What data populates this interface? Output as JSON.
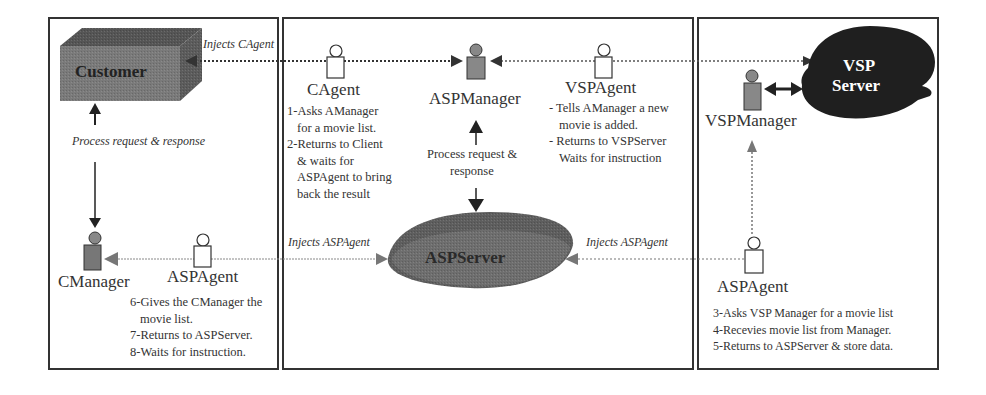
{
  "diagram": {
    "panels": [
      {
        "id": "client",
        "name": "client-panel"
      },
      {
        "id": "asp",
        "name": "asp-panel"
      },
      {
        "id": "vsp",
        "name": "vsp-panel"
      }
    ],
    "nodes": {
      "customer": {
        "label": "Customer",
        "shape": "3d-box",
        "fill": "#6e6e6e"
      },
      "cmanager": {
        "label": "CManager",
        "shape": "manager-figure"
      },
      "aspagent_client": {
        "label": "ASPAgent",
        "shape": "agent-figure"
      },
      "cagent": {
        "label": "CAgent",
        "shape": "agent-figure"
      },
      "aspmanager": {
        "label": "ASPManager",
        "shape": "manager-figure"
      },
      "vspagent": {
        "label": "VSPAgent",
        "shape": "agent-figure"
      },
      "aspserver": {
        "label": "ASPServer",
        "shape": "ellipse-3d",
        "fill": "#5a5a5a"
      },
      "vspmanager": {
        "label": "VSPManager",
        "shape": "manager-figure"
      },
      "vspserver": {
        "label_line1": "VSP",
        "label_line2": "Server",
        "shape": "cloud",
        "fill": "#1e1e1e"
      },
      "aspagent_vsp": {
        "label": "ASPAgent",
        "shape": "agent-figure"
      }
    },
    "edge_labels": {
      "injects_cagent": "Injects CAgent",
      "process_client": "Process request & response",
      "process_asp_line1": "Process request &",
      "process_asp_line2": "response",
      "injects_aspagent_left": "Injects ASPAgent",
      "injects_aspagent_right": "Injects ASPAgent"
    },
    "notes": {
      "cagent": [
        "1-Asks AManager",
        "for a movie list.",
        "2-Returns to Client",
        "& waits for",
        "ASPAgent to bring",
        "back the result"
      ],
      "vspagent": [
        "- Tells AManager a new",
        "movie is added.",
        "- Returns to VSPServer",
        "Waits for instruction"
      ],
      "aspagent_client": [
        "6-Gives the CManager the",
        "movie list.",
        "7-Returns to ASPServer.",
        "8-Waits for instruction."
      ],
      "aspagent_vsp": [
        "3-Asks VSP Manager for a movie list",
        "4-Recevies movie list from Manager.",
        "5-Returns to ASPServer & store data."
      ]
    }
  }
}
